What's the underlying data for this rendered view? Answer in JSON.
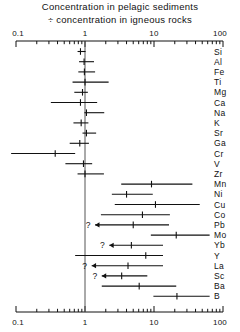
{
  "chart": {
    "title_line1": "Concentration in pelagic sediments",
    "title_line2": "÷ concentration in igneous rocks",
    "axis_tick_labels": [
      "0.1",
      "1",
      "10",
      "100"
    ]
  },
  "chart_data": {
    "type": "bar",
    "title": "Concentration in pelagic sediments ÷ concentration in igneous rocks",
    "subtitle": "",
    "xlabel": "",
    "ylabel": "",
    "xscale": "log",
    "xlim": [
      0.1,
      100
    ],
    "grid": false,
    "legend": null,
    "axis_ticks_major": [
      0.1,
      1,
      10,
      100
    ],
    "reference_line": 1,
    "categories": [
      "Si",
      "Al",
      "Fe",
      "Ti",
      "Mg",
      "Ca",
      "Na",
      "K",
      "Sr",
      "Ga",
      "Cr",
      "V",
      "Zr",
      "Mn",
      "Ni",
      "Cu",
      "Co",
      "Pb",
      "Mo",
      "Yb",
      "Y",
      "La",
      "Sc",
      "Ba",
      "B"
    ],
    "points": [
      {
        "element": "Si",
        "low": 0.78,
        "center": 0.86,
        "high": 1.02,
        "uncertain": false,
        "arrow": false
      },
      {
        "element": "Al",
        "low": 0.82,
        "center": 0.97,
        "high": 1.35,
        "uncertain": false,
        "arrow": false
      },
      {
        "element": "Fe",
        "low": 0.8,
        "center": 0.98,
        "high": 1.4,
        "uncertain": false,
        "arrow": false
      },
      {
        "element": "Ti",
        "low": 0.66,
        "center": 1.0,
        "high": 2.2,
        "uncertain": false,
        "arrow": false
      },
      {
        "element": "Mg",
        "low": 0.7,
        "center": 0.92,
        "high": 1.1,
        "uncertain": false,
        "arrow": false
      },
      {
        "element": "Ca",
        "low": 0.32,
        "center": 0.86,
        "high": 1.5,
        "uncertain": false,
        "arrow": false
      },
      {
        "element": "Na",
        "low": 0.98,
        "center": 1.05,
        "high": 1.9,
        "uncertain": false,
        "arrow": false
      },
      {
        "element": "K",
        "low": 0.68,
        "center": 0.88,
        "high": 1.12,
        "uncertain": false,
        "arrow": false
      },
      {
        "element": "Sr",
        "low": 0.92,
        "center": 1.05,
        "high": 1.45,
        "uncertain": false,
        "arrow": false
      },
      {
        "element": "Ga",
        "low": 0.6,
        "center": 0.84,
        "high": 1.14,
        "uncertain": false,
        "arrow": false
      },
      {
        "element": "Cr",
        "low": 0.085,
        "center": 0.37,
        "high": 0.72,
        "uncertain": false,
        "arrow": false
      },
      {
        "element": "V",
        "low": 0.52,
        "center": 0.95,
        "high": 1.27,
        "uncertain": false,
        "arrow": false
      },
      {
        "element": "Zr",
        "low": 0.78,
        "center": 1.0,
        "high": 1.88,
        "uncertain": false,
        "arrow": false
      },
      {
        "element": "Mn",
        "low": 3.35,
        "center": 9.2,
        "high": 36.0,
        "uncertain": false,
        "arrow": false
      },
      {
        "element": "Ni",
        "low": 2.45,
        "center": 4.0,
        "high": 9.6,
        "uncertain": false,
        "arrow": false
      },
      {
        "element": "Cu",
        "low": 2.7,
        "center": 10.5,
        "high": 46.0,
        "uncertain": false,
        "arrow": false
      },
      {
        "element": "Co",
        "low": 1.7,
        "center": 6.8,
        "high": 17.0,
        "uncertain": false,
        "arrow": false
      },
      {
        "element": "Pb",
        "low": 1.4,
        "center": 5.0,
        "high": 16.5,
        "uncertain": true,
        "arrow": true
      },
      {
        "element": "Mo",
        "low": 9.0,
        "center": 21.0,
        "high": 64.0,
        "uncertain": false,
        "arrow": false
      },
      {
        "element": "Yb",
        "low": 2.25,
        "center": 4.7,
        "high": 13.5,
        "uncertain": true,
        "arrow": true
      },
      {
        "element": "Y",
        "low": 0.72,
        "center": 7.6,
        "high": 13.5,
        "uncertain": false,
        "arrow": false
      },
      {
        "element": "La",
        "low": 1.25,
        "center": 4.2,
        "high": 13.5,
        "uncertain": true,
        "arrow": true
      },
      {
        "element": "Sc",
        "low": 1.75,
        "center": 3.4,
        "high": 8.0,
        "uncertain": true,
        "arrow": true
      },
      {
        "element": "Ba",
        "low": 1.75,
        "center": 6.1,
        "high": 21.0,
        "uncertain": false,
        "arrow": false
      },
      {
        "element": "B",
        "low": 9.8,
        "center": 21.5,
        "high": 64.0,
        "uncertain": false,
        "arrow": false
      }
    ]
  }
}
